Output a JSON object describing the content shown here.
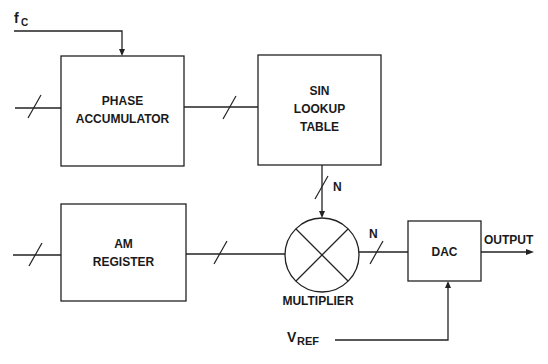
{
  "diagram": {
    "blocks": {
      "phase_accumulator": {
        "line1": "PHASE",
        "line2": "ACCUMULATOR"
      },
      "sin_lookup": {
        "line1": "SIN",
        "line2": "LOOKUP",
        "line3": "TABLE"
      },
      "am_register": {
        "line1": "AM",
        "line2": "REGISTER"
      },
      "multiplier": {
        "label": "MULTIPLIER"
      },
      "dac": {
        "label": "DAC"
      }
    },
    "signals": {
      "fc": {
        "main": "f",
        "sub": "C"
      },
      "vref": {
        "main": "V",
        "sub": "REF"
      },
      "output": "OUTPUT",
      "bus_width_sin": "N",
      "bus_width_mult": "N"
    },
    "colors": {
      "line": "#222222",
      "text": "#1a1a1a",
      "background": "#ffffff"
    }
  }
}
